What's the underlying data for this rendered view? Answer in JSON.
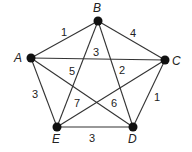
{
  "graph": {
    "nodes": [
      {
        "id": "A",
        "x": 31,
        "y": 58,
        "lx": 14,
        "ly": 62
      },
      {
        "id": "B",
        "x": 98,
        "y": 21,
        "lx": 93,
        "ly": 12
      },
      {
        "id": "C",
        "x": 165,
        "y": 60,
        "lx": 172,
        "ly": 65
      },
      {
        "id": "D",
        "x": 133,
        "y": 127,
        "lx": 128,
        "ly": 143
      },
      {
        "id": "E",
        "x": 57,
        "y": 127,
        "lx": 52,
        "ly": 143
      }
    ],
    "edges": [
      {
        "from": "A",
        "to": "B",
        "weight": "1",
        "lx": 61,
        "ly": 36
      },
      {
        "from": "B",
        "to": "C",
        "weight": "4",
        "lx": 130,
        "ly": 37
      },
      {
        "from": "A",
        "to": "C",
        "weight": "3",
        "lx": 93,
        "ly": 56
      },
      {
        "from": "B",
        "to": "E",
        "weight": "5",
        "lx": 69,
        "ly": 75
      },
      {
        "from": "B",
        "to": "D",
        "weight": "2",
        "lx": 119,
        "ly": 74
      },
      {
        "from": "A",
        "to": "E",
        "weight": "3",
        "lx": 32,
        "ly": 98
      },
      {
        "from": "A",
        "to": "D",
        "weight": "7",
        "lx": 74,
        "ly": 107
      },
      {
        "from": "C",
        "to": "E",
        "weight": "6",
        "lx": 111,
        "ly": 107
      },
      {
        "from": "C",
        "to": "D",
        "weight": "1",
        "lx": 154,
        "ly": 101
      },
      {
        "from": "E",
        "to": "D",
        "weight": "3",
        "lx": 89,
        "ly": 142
      }
    ]
  }
}
